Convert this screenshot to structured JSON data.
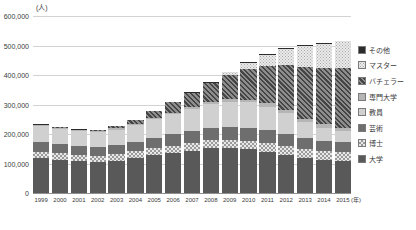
{
  "chart_data": {
    "type": "bar",
    "stacked": true,
    "title": "",
    "subtitle": "",
    "xlabel": "(年)",
    "ylabel": "(人)",
    "ylim": [
      0,
      600000
    ],
    "ytick_step": 100000,
    "grid": true,
    "legend_position": "right",
    "ytick_labels": [
      "600,000",
      "500,000",
      "400,000",
      "300,000",
      "200,000",
      "100,000",
      "0"
    ],
    "ytick_values": [
      600000,
      500000,
      400000,
      300000,
      200000,
      100000,
      0
    ],
    "categories": [
      "1999",
      "2000",
      "2001",
      "2002",
      "2003",
      "2004",
      "2005",
      "2006",
      "2007",
      "2008",
      "2009",
      "2010",
      "2011",
      "2012",
      "2013",
      "2014",
      "2015"
    ],
    "series": [
      {
        "name": "大学",
        "key": "daigaku",
        "fill": "solid-dark",
        "color": "#595959",
        "values": [
          118000,
          112000,
          108000,
          106000,
          110000,
          118000,
          128000,
          136000,
          144000,
          152000,
          152000,
          148000,
          140000,
          130000,
          118000,
          112000,
          108000
        ]
      },
      {
        "name": "博士",
        "key": "hakase",
        "fill": "checker-light",
        "color": "#e8e8e8",
        "values": [
          22000,
          22000,
          21000,
          21000,
          22000,
          23000,
          24000,
          25000,
          26000,
          27000,
          28000,
          29000,
          30000,
          30000,
          30000,
          31000,
          31000
        ]
      },
      {
        "name": "芸術",
        "key": "geijutsu",
        "fill": "solid-mid",
        "color": "#6e6e6e",
        "values": [
          33000,
          32000,
          30000,
          30000,
          31000,
          33000,
          36000,
          38000,
          41000,
          43000,
          44000,
          44000,
          43000,
          41000,
          37000,
          35000,
          33000
        ]
      },
      {
        "name": "教員",
        "key": "kyouin",
        "fill": "solid-light",
        "color": "#d0d0d0",
        "values": [
          54000,
          52000,
          50000,
          49000,
          52000,
          56000,
          62000,
          68000,
          74000,
          80000,
          85000,
          86000,
          80000,
          70000,
          55000,
          44000,
          37000
        ]
      },
      {
        "name": "専門大学",
        "key": "senmon",
        "fill": "solid-medium",
        "color": "#b5b5b5",
        "values": [
          3000,
          3000,
          3000,
          3000,
          4000,
          4000,
          5000,
          6000,
          7000,
          8000,
          9000,
          10000,
          11000,
          11000,
          11000,
          11000,
          11000
        ]
      },
      {
        "name": "バチェラー",
        "key": "bachelor",
        "fill": "diagonal-hatch",
        "color": "#6b6b6b",
        "values": [
          2000,
          2000,
          3000,
          4000,
          7000,
          13000,
          22000,
          34000,
          48000,
          64000,
          82000,
          102000,
          126000,
          152000,
          176000,
          192000,
          204000
        ]
      },
      {
        "name": "マスター",
        "key": "master",
        "fill": "fine-dots",
        "color": "#ebebeb",
        "values": [
          0,
          0,
          0,
          0,
          0,
          0,
          0,
          0,
          0,
          0,
          10000,
          22000,
          38000,
          55000,
          72000,
          82000,
          90000
        ]
      },
      {
        "name": "その他",
        "key": "sonota",
        "fill": "solid-black",
        "color": "#2b2b2b",
        "values": [
          2000,
          2000,
          2000,
          2000,
          2000,
          2000,
          2000,
          2000,
          2000,
          2000,
          2000,
          2000,
          2000,
          2000,
          2000,
          2000,
          2000
        ]
      }
    ],
    "totals": [
      234000,
      225000,
      217000,
      215000,
      228000,
      249000,
      279000,
      309000,
      342000,
      376000,
      412000,
      443000,
      470000,
      491000,
      501000,
      509000,
      516000
    ]
  },
  "legend": {
    "items": [
      {
        "label": "その他",
        "key": "sonota"
      },
      {
        "label": "マスター",
        "key": "master"
      },
      {
        "label": "バチェラー",
        "key": "bachelor"
      },
      {
        "label": "専門大学",
        "key": "senmon"
      },
      {
        "label": "教員",
        "key": "kyouin"
      },
      {
        "label": "芸術",
        "key": "geijutsu"
      },
      {
        "label": "博士",
        "key": "hakase"
      },
      {
        "label": "大学",
        "key": "daigaku"
      }
    ]
  },
  "axis": {
    "y_unit": "(人)",
    "x_unit": "(年)"
  }
}
